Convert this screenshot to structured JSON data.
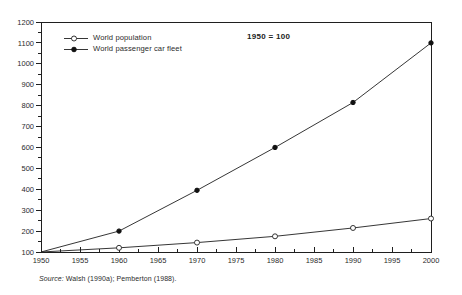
{
  "colors": {
    "line": "#1f1f1f",
    "text": "#2b2b2b",
    "marker_fill": "#111111",
    "marker_open_fill": "#ffffff",
    "background": "#ffffff"
  },
  "chart_data": {
    "type": "line",
    "title": "1950 = 100",
    "xlabel": "",
    "ylabel": "",
    "x": [
      1950,
      1960,
      1970,
      1980,
      1990,
      2000
    ],
    "x_ticks": [
      1950,
      1955,
      1960,
      1965,
      1970,
      1975,
      1980,
      1985,
      1990,
      1995,
      2000
    ],
    "x_minor_step": 2.5,
    "xlim": [
      1950,
      2000
    ],
    "y_ticks": [
      100,
      200,
      300,
      400,
      500,
      600,
      700,
      800,
      900,
      1000,
      1100,
      1200
    ],
    "y_minor_step": 50,
    "ylim": [
      100,
      1200
    ],
    "grid": false,
    "legend_position": "top-left",
    "series": [
      {
        "name": "World population",
        "marker": "open-circle",
        "values": [
          100,
          120,
          145,
          175,
          215,
          260
        ]
      },
      {
        "name": "World passenger car fleet",
        "marker": "filled-circle",
        "values": [
          100,
          200,
          395,
          600,
          815,
          1100
        ]
      }
    ],
    "source_prefix": "Source:",
    "source_rest": " Walsh (1990a); Pemberton (1988)."
  }
}
